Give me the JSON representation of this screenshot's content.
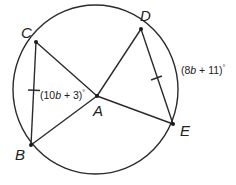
{
  "figure": {
    "type": "geometry",
    "points": {
      "A": {
        "label": "A",
        "x": 97,
        "y": 96
      },
      "B": {
        "label": "B",
        "x": 31,
        "y": 145
      },
      "C": {
        "label": "C",
        "x": 36,
        "y": 42
      },
      "D": {
        "label": "D",
        "x": 141,
        "y": 29
      },
      "E": {
        "label": "E",
        "x": 173,
        "y": 124
      }
    },
    "circle": {
      "cx": 95.5,
      "cy": 89.5,
      "rx": 82.5,
      "ry": 84.5
    },
    "angle_labels": {
      "CAB": {
        "prefix": "(10",
        "var": "b",
        "suffix": " + 3)",
        "degree": "°"
      },
      "arc_DE": {
        "prefix": "(8",
        "var": "b",
        "suffix": " + 11)",
        "degree": "°"
      }
    },
    "congruence_marks": [
      "chord CB",
      "chord DE"
    ],
    "stroke_color": "#2b2b2b"
  }
}
